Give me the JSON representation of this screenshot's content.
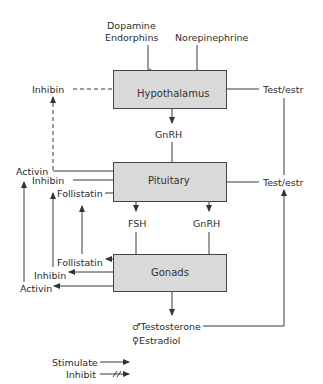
{
  "diagram": {
    "nodes": {
      "hypothalamus": "Hypothalamus",
      "pituitary": "Pituitary",
      "gonads": "Gonads"
    },
    "top_inputs": {
      "dopamine": "Dopamine",
      "endorphins": "Endorphins",
      "norepinephrine": "Norepinephrine"
    },
    "hypothalamus_inputs": {
      "inhibin": "Inhibin",
      "test_estr": "Test/estr"
    },
    "hypothalamus_output": "GnRH",
    "pituitary_inputs": {
      "activin": "Activin",
      "inhibin": "Inhibin",
      "follistatin": "Follistatin",
      "test_estr": "Test/estr"
    },
    "pituitary_outputs": {
      "left": "FSH",
      "right": "GnRH"
    },
    "gonad_outputs_left": {
      "follistatin": "Follistatin",
      "inhibin": "Inhibin",
      "activin": "Activin"
    },
    "gonad_outputs_bottom": {
      "testosterone": "♂Testosterone",
      "estradiol": "♀Estradiol"
    },
    "legend": {
      "stimulate": "Stimulate",
      "inhibit": "Inhibit"
    },
    "colors": {
      "box_fill": "#d9d9d9",
      "line": "#3a3a3a"
    }
  }
}
